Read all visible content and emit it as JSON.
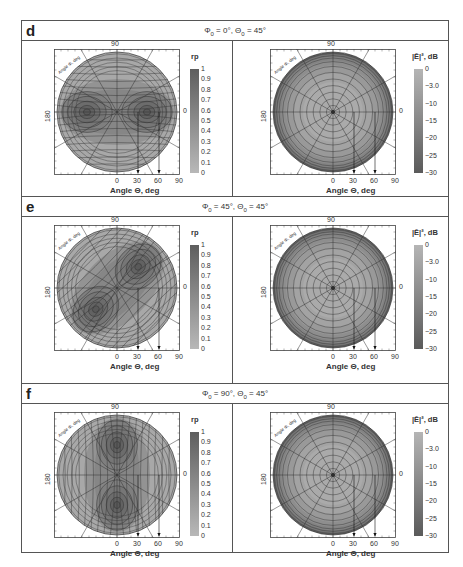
{
  "figure": {
    "panels": [
      {
        "letter": "d",
        "params": {
          "phi": "Φ",
          "phi_sub": "0",
          "phi_val": " = 0°, ",
          "theta": "Θ",
          "theta_sub": "0",
          "theta_val": " = 45°"
        },
        "params_text": "Φ0 = 0°, Θ0 = 45°",
        "left_plot": {
          "colorbar_label": "rp",
          "colorbar_ticks": [
            "1",
            "0.9",
            "0.8",
            "0.7",
            "0.6",
            "0.5",
            "0.4",
            "0.3",
            "0.2",
            "0.1",
            "0"
          ],
          "pattern": "two-lobes-horizontal"
        },
        "right_plot": {
          "colorbar_label": "|Ē|², dB",
          "colorbar_ticks": [
            "0",
            "−3.0",
            "−10",
            "−15",
            "−20",
            "−25",
            "−30"
          ]
        }
      },
      {
        "letter": "e",
        "params_text": "Φ0 = 45°, Θ0 = 45°",
        "params": {
          "phi": "Φ",
          "phi_sub": "0",
          "phi_val": " = 45°, ",
          "theta": "Θ",
          "theta_sub": "0",
          "theta_val": " = 45°"
        },
        "left_plot": {
          "colorbar_label": "rp",
          "colorbar_ticks": [
            "1",
            "0.9",
            "0.8",
            "0.7",
            "0.6",
            "0.5",
            "0.4",
            "0.3",
            "0.2",
            "0.1",
            "0"
          ],
          "pattern": "two-lobes-diagonal"
        },
        "right_plot": {
          "colorbar_label": "|Ē|², dB",
          "colorbar_ticks": [
            "0",
            "−3.0",
            "−10",
            "−15",
            "−20",
            "−25",
            "−30"
          ]
        }
      },
      {
        "letter": "f",
        "params_text": "Φ0 = 90°, Θ0 = 45°",
        "params": {
          "phi": "Φ",
          "phi_sub": "0",
          "phi_val": " = 90°, ",
          "theta": "Θ",
          "theta_sub": "0",
          "theta_val": " = 45°"
        },
        "left_plot": {
          "colorbar_label": "rp",
          "colorbar_ticks": [
            "1",
            "0.9",
            "0.8",
            "0.7",
            "0.6",
            "0.5",
            "0.4",
            "0.3",
            "0.2",
            "0.1",
            "0"
          ],
          "pattern": "two-lobes-vertical"
        },
        "right_plot": {
          "colorbar_label": "|Ē|², dB",
          "colorbar_ticks": [
            "0",
            "−3.0",
            "−10",
            "−15",
            "−20",
            "−25",
            "−30"
          ]
        }
      }
    ],
    "axes": {
      "top_tick": "90",
      "left_tick": "180",
      "right_tick": "0",
      "bottom_ticks": [
        "0",
        "30",
        "60",
        "90"
      ],
      "xlabel": "Angle Θ, deg",
      "corner_label": "Angle Φ, deg"
    }
  },
  "chart_data": [
    {
      "type": "heatmap",
      "panel": "d",
      "title": "Φ0 = 0°, Θ0 = 45°",
      "subplot": "left",
      "colorbar": "rp",
      "range": [
        0,
        1
      ],
      "xlabel": "Angle Θ, deg",
      "x_ticks": [
        0,
        30,
        60,
        90
      ],
      "polar_angle_ticks": [
        0,
        90,
        180
      ],
      "maxima": [
        {
          "phi": 0,
          "theta": 45
        },
        {
          "phi": 180,
          "theta": 45
        }
      ]
    },
    {
      "type": "heatmap",
      "panel": "d",
      "title": "Φ0 = 0°, Θ0 = 45°",
      "subplot": "right",
      "colorbar": "|Ē|², dB",
      "range": [
        -30,
        0
      ],
      "colorbar_ticks": [
        0,
        -3.0,
        -10,
        -15,
        -20,
        -25,
        -30
      ],
      "xlabel": "Angle Θ, deg",
      "x_ticks": [
        0,
        30,
        60,
        90
      ]
    },
    {
      "type": "heatmap",
      "panel": "e",
      "title": "Φ0 = 45°, Θ0 = 45°",
      "subplot": "left",
      "colorbar": "rp",
      "range": [
        0,
        1
      ],
      "xlabel": "Angle Θ, deg",
      "x_ticks": [
        0,
        30,
        60,
        90
      ],
      "maxima": [
        {
          "phi": 45,
          "theta": 45
        },
        {
          "phi": 225,
          "theta": 45
        }
      ]
    },
    {
      "type": "heatmap",
      "panel": "e",
      "title": "Φ0 = 45°, Θ0 = 45°",
      "subplot": "right",
      "colorbar": "|Ē|², dB",
      "range": [
        -30,
        0
      ],
      "colorbar_ticks": [
        0,
        -3.0,
        -10,
        -15,
        -20,
        -25,
        -30
      ],
      "xlabel": "Angle Θ, deg",
      "x_ticks": [
        0,
        30,
        60,
        90
      ]
    },
    {
      "type": "heatmap",
      "panel": "f",
      "title": "Φ0 = 90°, Θ0 = 45°",
      "subplot": "left",
      "colorbar": "rp",
      "range": [
        0,
        1
      ],
      "xlabel": "Angle Θ, deg",
      "x_ticks": [
        0,
        30,
        60,
        90
      ],
      "maxima": [
        {
          "phi": 90,
          "theta": 45
        },
        {
          "phi": 270,
          "theta": 45
        }
      ]
    },
    {
      "type": "heatmap",
      "panel": "f",
      "title": "Φ0 = 90°, Θ0 = 45°",
      "subplot": "right",
      "colorbar": "|Ē|², dB",
      "range": [
        -30,
        0
      ],
      "colorbar_ticks": [
        0,
        -3.0,
        -10,
        -15,
        -20,
        -25,
        -30
      ],
      "xlabel": "Angle Θ, deg",
      "x_ticks": [
        0,
        30,
        60,
        90
      ]
    }
  ]
}
